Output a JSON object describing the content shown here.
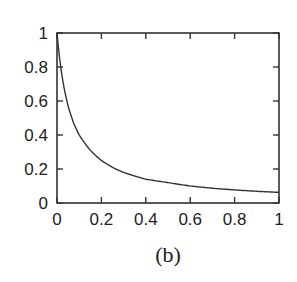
{
  "caption": "(b)",
  "chart_data": {
    "type": "line",
    "title": "",
    "xlabel": "",
    "ylabel": "",
    "xlim": [
      0,
      1
    ],
    "ylim": [
      0,
      1
    ],
    "xticks": [
      0,
      0.2,
      0.4,
      0.6,
      0.8,
      1
    ],
    "xtick_labels": [
      "0",
      "0.2",
      "0.4",
      "0.6",
      "0.8",
      "1"
    ],
    "yticks": [
      0,
      0.2,
      0.4,
      0.6,
      0.8,
      1
    ],
    "ytick_labels": [
      "0",
      "0.2",
      "0.4",
      "0.6",
      "0.8",
      "1"
    ],
    "grid": false,
    "legend": null,
    "series": [
      {
        "name": "curve",
        "color": "#333333",
        "x": [
          0,
          0.01,
          0.02,
          0.03,
          0.05,
          0.075,
          0.1,
          0.15,
          0.2,
          0.25,
          0.3,
          0.4,
          0.5,
          0.6,
          0.7,
          0.8,
          0.9,
          1.0
        ],
        "y": [
          1.0,
          0.87,
          0.77,
          0.69,
          0.57,
          0.47,
          0.4,
          0.31,
          0.25,
          0.21,
          0.18,
          0.14,
          0.12,
          0.1,
          0.087,
          0.077,
          0.069,
          0.0625
        ]
      }
    ]
  }
}
